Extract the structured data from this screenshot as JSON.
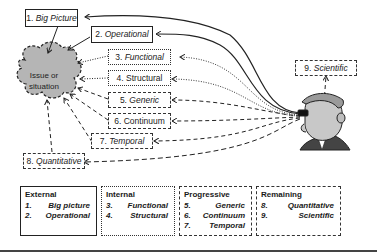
{
  "diagram": {
    "issue": "Issue or situation",
    "perspectives": [
      {
        "num": "1.",
        "name": "Big Picture",
        "italic": true,
        "style": "solid"
      },
      {
        "num": "2.",
        "name": "Operational",
        "italic": true,
        "style": "solid"
      },
      {
        "num": "3.",
        "name": "Functional",
        "italic": true,
        "style": "dotted"
      },
      {
        "num": "4.",
        "name": "Structural",
        "italic": false,
        "style": "dotted"
      },
      {
        "num": "5.",
        "name": "Generic",
        "italic": true,
        "style": "dashed"
      },
      {
        "num": "6.",
        "name": "Continuum",
        "italic": false,
        "style": "dashed"
      },
      {
        "num": "7.",
        "name": "Temporal",
        "italic": true,
        "style": "dashed"
      },
      {
        "num": "8.",
        "name": "Quantitative",
        "italic": true,
        "style": "dashed"
      },
      {
        "num": "9.",
        "name": "Scientific",
        "italic": true,
        "style": "dashed"
      }
    ],
    "observer": "person-with-binoculars"
  },
  "legend": [
    {
      "title": "External",
      "style": "solid",
      "items": [
        {
          "num": "1.",
          "name": "Big picture"
        },
        {
          "num": "2.",
          "name": "Operational"
        }
      ]
    },
    {
      "title": "Internal",
      "style": "dotted",
      "items": [
        {
          "num": "3.",
          "name": "Functional"
        },
        {
          "num": "4.",
          "name": "Structural"
        }
      ]
    },
    {
      "title": "Progressive",
      "style": "dashed",
      "items": [
        {
          "num": "5.",
          "name": "Generic"
        },
        {
          "num": "6.",
          "name": "Continuum"
        },
        {
          "num": "7.",
          "name": "Temporal"
        }
      ]
    },
    {
      "title": "Remaining",
      "style": "dashed",
      "items": [
        {
          "num": "8.",
          "name": "Quantitative"
        },
        {
          "num": "9.",
          "name": "Scientific"
        }
      ]
    }
  ]
}
